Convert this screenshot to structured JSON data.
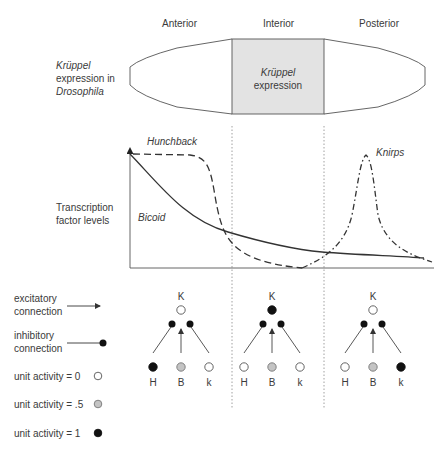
{
  "regions": {
    "anterior": "Anterior",
    "interior": "Interior",
    "posterior": "Posterior"
  },
  "embryo": {
    "side_label": {
      "line1": "Krüppel",
      "line2": "expression in",
      "line3": "Drosophila"
    },
    "center_label": {
      "line1": "Krüppel",
      "line2": "expression"
    },
    "center_fill": "#e3e3e3"
  },
  "gradients": {
    "side_label": {
      "line1": "Transcription",
      "line2": "factor levels"
    },
    "curves": {
      "hunchback": "Hunchback",
      "bicoid": "Bicoid",
      "knirps": "Knirps"
    }
  },
  "legend": {
    "excitatory": {
      "line1": "excitatory",
      "line2": "connection"
    },
    "inhibitory": {
      "line1": "inhibitory",
      "line2": "connection"
    },
    "activity_0": "unit activity = 0",
    "activity_05": "unit activity = .5",
    "activity_1": "unit activity = 1",
    "colors": {
      "zero": "#ffffff",
      "half": "#c4c4c4",
      "one": "#111111"
    }
  },
  "networks": [
    {
      "region": "Anterior",
      "output_label": "K",
      "output_activity": 0,
      "inputs": [
        {
          "label": "H",
          "activity": 1
        },
        {
          "label": "B",
          "activity": 0.5
        },
        {
          "label": "k",
          "activity": 0
        }
      ]
    },
    {
      "region": "Interior",
      "output_label": "K",
      "output_activity": 1,
      "inputs": [
        {
          "label": "H",
          "activity": 0
        },
        {
          "label": "B",
          "activity": 0.5
        },
        {
          "label": "k",
          "activity": 0
        }
      ]
    },
    {
      "region": "Posterior",
      "output_label": "K",
      "output_activity": 0,
      "inputs": [
        {
          "label": "H",
          "activity": 0
        },
        {
          "label": "B",
          "activity": 0.5
        },
        {
          "label": "k",
          "activity": 1
        }
      ]
    }
  ],
  "chart_data": {
    "type": "line",
    "title": "Transcription factor levels",
    "xlabel": "Anterior → Posterior position",
    "ylabel": "Transcription factor levels",
    "x_regions": [
      "Anterior",
      "Interior",
      "Posterior"
    ],
    "grid": false,
    "series": [
      {
        "name": "Bicoid",
        "style": "solid",
        "x": [
          0,
          0.1,
          0.2,
          0.3,
          0.4,
          0.5,
          0.6,
          0.7,
          0.8,
          0.9,
          0.97
        ],
        "values": [
          1.0,
          0.78,
          0.56,
          0.38,
          0.27,
          0.2,
          0.15,
          0.12,
          0.1,
          0.08,
          0.07
        ]
      },
      {
        "name": "Hunchback",
        "style": "dashed",
        "x": [
          0,
          0.15,
          0.22,
          0.26,
          0.3,
          0.34,
          0.4,
          0.5,
          0.57
        ],
        "values": [
          0.98,
          0.97,
          0.88,
          0.6,
          0.3,
          0.15,
          0.07,
          0.02,
          0.0
        ]
      },
      {
        "name": "Knirps",
        "style": "dash-dot",
        "x": [
          0.57,
          0.65,
          0.72,
          0.76,
          0.79,
          0.82,
          0.86,
          0.92,
          1.0
        ],
        "values": [
          0.0,
          0.15,
          0.45,
          0.9,
          0.97,
          0.85,
          0.35,
          0.15,
          0.06
        ]
      }
    ],
    "ylim": [
      0,
      1
    ]
  }
}
